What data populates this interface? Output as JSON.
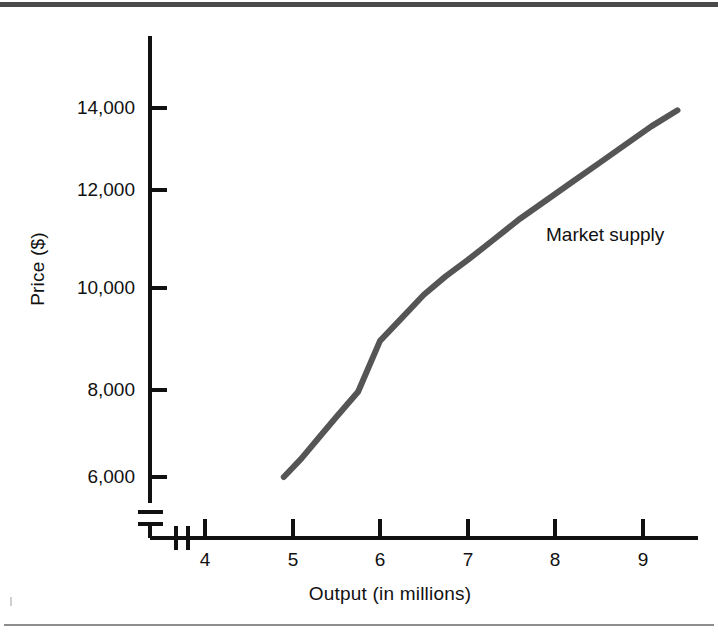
{
  "figure": {
    "background_color": "#ffffff",
    "rule_color_top": "#4a4a4a",
    "rule_color_bottom": "#8d8d8d",
    "axis_color": "#111111",
    "curve_color": "#555555"
  },
  "chart_data": {
    "type": "line",
    "title": "",
    "xlabel": "Output (in millions)",
    "ylabel": "Price ($)",
    "xlim": [
      3.6,
      9.6
    ],
    "ylim": [
      5500,
      14800
    ],
    "grid": false,
    "axis_break_x": true,
    "axis_break_y": true,
    "legend_position": "inline-annotation",
    "xticks": [
      4,
      5,
      6,
      7,
      8,
      9
    ],
    "xtick_labels": [
      "4",
      "5",
      "6",
      "7",
      "8",
      "9"
    ],
    "yticks": [
      6000,
      8000,
      10000,
      12000,
      14000
    ],
    "ytick_labels": [
      "6,000",
      "8,000",
      "10,000",
      "12,000",
      "14,000"
    ],
    "series": [
      {
        "name": "Market supply",
        "annotation": "Market supply",
        "color": "#555555",
        "x": [
          4.9,
          5.1,
          5.3,
          5.5,
          5.75,
          6.0,
          6.25,
          6.5,
          6.75,
          7.0,
          7.3,
          7.6,
          7.9,
          8.2,
          8.5,
          8.8,
          9.1,
          9.4
        ],
        "y": [
          6000,
          6400,
          6850,
          7300,
          7850,
          8950,
          9450,
          9950,
          10350,
          10700,
          11150,
          11600,
          12000,
          12400,
          12800,
          13200,
          13600,
          13950
        ]
      }
    ]
  },
  "annotations": {
    "series_label": "Market supply"
  }
}
